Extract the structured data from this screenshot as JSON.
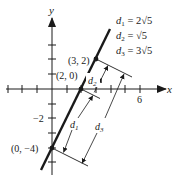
{
  "diagram": {
    "axes": {
      "x_label": "x",
      "y_label": "y",
      "x_tick_label": "6",
      "y_tick_label": "−2"
    },
    "points": [
      {
        "label": "(3, 2)",
        "x": 3,
        "y": 2
      },
      {
        "label": "(2, 0)",
        "x": 2,
        "y": 0
      },
      {
        "label": "(0, −4)",
        "x": 0,
        "y": -4
      }
    ],
    "line": {
      "equation": "y = 2x - 4"
    },
    "dimensions": [
      {
        "name": "d1",
        "sym": "d",
        "sub": "1"
      },
      {
        "name": "d2",
        "sym": "d",
        "sub": "2"
      },
      {
        "name": "d3",
        "sym": "d",
        "sub": "3"
      }
    ],
    "legend": [
      {
        "sym": "d",
        "sub": "1",
        "eq": " = ",
        "value": "2√5"
      },
      {
        "sym": "d",
        "sub": "2",
        "eq": " = ",
        "value": "√5"
      },
      {
        "sym": "d",
        "sub": "3",
        "eq": " = ",
        "value": "3√5"
      }
    ],
    "colors": {
      "ink": "#1a1a1a",
      "background": "#ffffff"
    }
  }
}
